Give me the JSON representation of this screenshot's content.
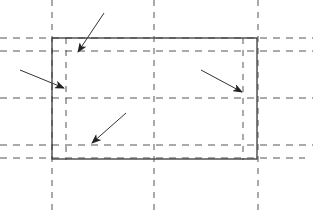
{
  "diagram": {
    "width": 313,
    "height": 211,
    "background": "#ffffff",
    "line_color": "#555555",
    "solid_color": "#3a3a3a",
    "arrow_color": "#333333",
    "rectangle": {
      "x1": 52,
      "y1": 38,
      "x2": 257,
      "y2": 159
    },
    "dashed_vertical": [
      {
        "x": 52,
        "y1": 0,
        "y2": 211
      },
      {
        "x": 66,
        "y1": 38,
        "y2": 160
      },
      {
        "x": 154,
        "y1": 0,
        "y2": 211
      },
      {
        "x": 243,
        "y1": 38,
        "y2": 160
      },
      {
        "x": 258,
        "y1": 0,
        "y2": 211
      }
    ],
    "dashed_horizontal": [
      {
        "y": 38,
        "x1": 0,
        "x2": 313
      },
      {
        "y": 51,
        "x1": 0,
        "x2": 313
      },
      {
        "y": 98,
        "x1": 0,
        "x2": 313
      },
      {
        "y": 145,
        "x1": 0,
        "x2": 313
      },
      {
        "y": 158,
        "x1": 0,
        "x2": 305
      }
    ],
    "arrows": [
      {
        "name": "arrow-top-left",
        "x1": 104,
        "y1": 13,
        "x2": 78,
        "y2": 52
      },
      {
        "name": "arrow-left",
        "x1": 20,
        "y1": 70,
        "x2": 64,
        "y2": 88
      },
      {
        "name": "arrow-right",
        "x1": 201,
        "y1": 70,
        "x2": 242,
        "y2": 92
      },
      {
        "name": "arrow-bottom-left",
        "x1": 126,
        "y1": 113,
        "x2": 92,
        "y2": 143
      }
    ]
  }
}
